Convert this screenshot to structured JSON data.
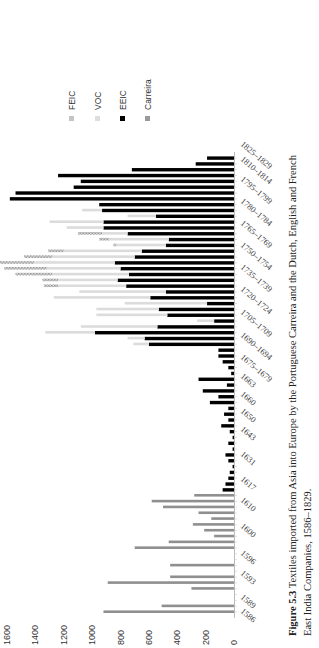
{
  "caption": {
    "label": "Figure 5.3",
    "line1": "Textiles imported from Asia into Europe by the Portuguese Carreira and the Dutch, English and French",
    "line2": "East India Companies, 1586–1829."
  },
  "legend": [
    {
      "name": "FEIC",
      "color": "#c4c4c4"
    },
    {
      "name": "VOC",
      "color": "#dedede"
    },
    {
      "name": "EEIC",
      "color": "#000000"
    },
    {
      "name": "Carreira",
      "color": "#a0a0a0"
    }
  ],
  "chart_data": {
    "type": "bar",
    "orientation": "stacked horizontal bars, page rotated 90° counter-clockwise",
    "title": "Textiles imported from Asia into Europe by the Portuguese Carreira and the Dutch, English and French East India Companies, 1586–1829",
    "xlabel": "",
    "ylabel": "",
    "value_axis_ticks": [
      0,
      200,
      400,
      600,
      800,
      1000,
      1200,
      1400,
      1600
    ],
    "value_range": [
      0,
      1600
    ],
    "category_tick_labels": [
      "1586",
      "1589",
      "1593",
      "1596",
      "1600",
      "1610",
      "1617",
      "1631",
      "1643",
      "1650",
      "1660",
      "1663",
      "1675–1679",
      "1690–1694",
      "1705–1709",
      "1720–1724",
      "1735–1739",
      "1750–1754",
      "1765–1769",
      "1780–1784",
      "1795–1799",
      "1810–1814",
      "1825–1829"
    ],
    "legend_position": "upper area (right of chart in unrotated view)",
    "grid": false,
    "series_order_from_axis": [
      "Carreira",
      "EEIC",
      "VOC",
      "FEIC"
    ],
    "bars_bottom_to_top": [
      {
        "Carreira": 920
      },
      {
        "Carreira": 510
      },
      {},
      {},
      {
        "Carreira": 300
      },
      {
        "Carreira": 890
      },
      {
        "Carreira": 450
      },
      {},
      {
        "Carreira": 450
      },
      {},
      {},
      {
        "Carreira": 700
      },
      {
        "Carreira": 460
      },
      {
        "Carreira": 140
      },
      {
        "Carreira": 210
      },
      {
        "Carreira": 290
      },
      {
        "Carreira": 160
      },
      {
        "Carreira": 250
      },
      {
        "Carreira": 500
      },
      {
        "Carreira": 580
      },
      {
        "Carreira": 280
      },
      {
        "EEIC": 80
      },
      {
        "EEIC": 60
      },
      {
        "EEIC": 40
      },
      {
        "EEIC": 30
      },
      {
        "EEIC": 10
      },
      {
        "EEIC": 40
      },
      {
        "EEIC": 60
      },
      {
        "EEIC": 10
      },
      {
        "EEIC": 40
      },
      {
        "EEIC": 10
      },
      {
        "EEIC": 30
      },
      {
        "EEIC": 90
      },
      {
        "EEIC": 40
      },
      {
        "EEIC": 70
      },
      {
        "EEIC": 40
      },
      {
        "EEIC": 170
      },
      {
        "EEIC": 110
      },
      {
        "EEIC": 220
      },
      {
        "EEIC": 50
      },
      {
        "EEIC": 250
      },
      {
        "EEIC": 20
      },
      {
        "EEIC": 40
      },
      {
        "EEIC": 80
      },
      {
        "EEIC": 110
      },
      {
        "EEIC": 110
      },
      {
        "EEIC": 600,
        "VOC": 110
      },
      {
        "EEIC": 630,
        "VOC": 120
      },
      {
        "EEIC": 980,
        "VOC": 350
      },
      {
        "EEIC": 540,
        "VOC": 540
      },
      {
        "EEIC": 140,
        "VOC": 120
      },
      {
        "EEIC": 470,
        "VOC": 500
      },
      {
        "EEIC": 530,
        "VOC": 440
      },
      {
        "EEIC": 190,
        "VOC": 580
      },
      {
        "EEIC": 590,
        "VOC": 680
      },
      {
        "EEIC": 480,
        "VOC": 610
      },
      {
        "EEIC": 760,
        "VOC": 480,
        "FEIC": 100
      },
      {
        "EEIC": 820,
        "VOC": 420,
        "FEIC": 110
      },
      {
        "EEIC": 740,
        "VOC": 540,
        "FEIC": 260
      },
      {
        "EEIC": 800,
        "VOC": 520,
        "FEIC": 300
      },
      {
        "EEIC": 840,
        "VOC": 570,
        "FEIC": 380
      },
      {
        "EEIC": 700,
        "VOC": 580,
        "FEIC": 200
      },
      {
        "EEIC": 650,
        "VOC": 550,
        "FEIC": 110
      },
      {
        "EEIC": 480,
        "VOC": 350,
        "FEIC": 20
      },
      {
        "EEIC": 460,
        "VOC": 420,
        "FEIC": 70
      },
      {
        "EEIC": 750,
        "VOC": 180,
        "FEIC": 170
      },
      {
        "EEIC": 920,
        "VOC": 260
      },
      {
        "EEIC": 920,
        "VOC": 380
      },
      {
        "EEIC": 550,
        "VOC": 200
      },
      {
        "EEIC": 930,
        "VOC": 140
      },
      {
        "EEIC": 950
      },
      {
        "EEIC": 1580
      },
      {
        "EEIC": 1540
      },
      {
        "EEIC": 1130
      },
      {
        "EEIC": 1080
      },
      {
        "EEIC": 1240
      },
      {
        "EEIC": 720
      },
      {
        "EEIC": 270
      },
      {
        "EEIC": 190
      }
    ]
  }
}
